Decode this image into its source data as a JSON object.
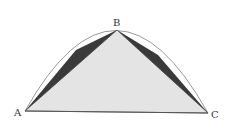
{
  "diagram": {
    "type": "parabolic-segment-quadrature",
    "points": {
      "A": {
        "label": "A",
        "x": 25,
        "y": 111
      },
      "B": {
        "label": "B",
        "x": 117,
        "y": 30
      },
      "C": {
        "label": "C",
        "x": 208,
        "y": 113
      }
    },
    "shapes": {
      "main_triangle": {
        "vertices": [
          "A",
          "B",
          "C"
        ],
        "fill": "#e4e4e4"
      },
      "left_small_triangle": {
        "fill": "#3a3a3a"
      },
      "right_small_triangle": {
        "fill": "#3a3a3a"
      },
      "parabola_arc": {
        "stroke": "#999999"
      }
    }
  }
}
